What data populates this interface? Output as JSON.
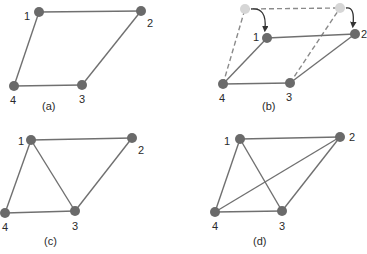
{
  "figure": {
    "panels": [
      {
        "id": "a",
        "caption": "(a)",
        "caption_pos": [
          42,
          110
        ],
        "nodes": [
          {
            "id": "1",
            "label": "1",
            "x": 39,
            "y": 12,
            "lx": 24,
            "ly": 20
          },
          {
            "id": "2",
            "label": "2",
            "x": 141,
            "y": 11,
            "lx": 147,
            "ly": 27
          },
          {
            "id": "3",
            "label": "3",
            "x": 82,
            "y": 85,
            "lx": 79,
            "ly": 103
          },
          {
            "id": "4",
            "label": "4",
            "x": 14,
            "y": 86,
            "lx": 10,
            "ly": 104
          }
        ],
        "edges": [
          [
            "1",
            "2"
          ],
          [
            "2",
            "3"
          ],
          [
            "3",
            "4"
          ],
          [
            "4",
            "1"
          ]
        ],
        "dashed_edges": []
      },
      {
        "id": "b",
        "caption": "(b)",
        "caption_pos": [
          262,
          110
        ],
        "nodes": [
          {
            "id": "1",
            "label": "1",
            "x": 267,
            "y": 38,
            "lx": 253,
            "ly": 41
          },
          {
            "id": "2",
            "label": "2",
            "x": 355,
            "y": 34,
            "lx": 361,
            "ly": 38
          },
          {
            "id": "3",
            "label": "3",
            "x": 290,
            "y": 83,
            "lx": 286,
            "ly": 101
          },
          {
            "id": "4",
            "label": "4",
            "x": 223,
            "y": 84,
            "lx": 219,
            "ly": 102
          }
        ],
        "ghost_nodes": [
          {
            "id": "1'",
            "x": 245,
            "y": 9
          },
          {
            "id": "2'",
            "x": 340,
            "y": 8
          }
        ],
        "edges": [
          [
            "1",
            "2"
          ],
          [
            "2",
            "3"
          ],
          [
            "3",
            "4"
          ],
          [
            "4",
            "1"
          ]
        ],
        "dashed_edges": [
          [
            "1'",
            "2'"
          ],
          [
            "4",
            "1'"
          ],
          [
            "3",
            "2'"
          ]
        ],
        "arrows": [
          {
            "from": "1'",
            "to": "1"
          },
          {
            "from": "2'",
            "to": "2"
          }
        ]
      },
      {
        "id": "c",
        "caption": "(c)",
        "caption_pos": [
          44,
          245
        ],
        "nodes": [
          {
            "id": "1",
            "label": "1",
            "x": 31,
            "y": 140,
            "lx": 18,
            "ly": 145
          },
          {
            "id": "2",
            "label": "2",
            "x": 132,
            "y": 138,
            "lx": 138,
            "ly": 154
          },
          {
            "id": "3",
            "label": "3",
            "x": 75,
            "y": 211,
            "lx": 72,
            "ly": 230
          },
          {
            "id": "4",
            "label": "4",
            "x": 5,
            "y": 213,
            "lx": 2,
            "ly": 231
          }
        ],
        "edges": [
          [
            "1",
            "2"
          ],
          [
            "2",
            "3"
          ],
          [
            "3",
            "4"
          ],
          [
            "4",
            "1"
          ],
          [
            "1",
            "3"
          ]
        ],
        "dashed_edges": []
      },
      {
        "id": "d",
        "caption": "(d)",
        "caption_pos": [
          253,
          245
        ],
        "nodes": [
          {
            "id": "1",
            "label": "1",
            "x": 240,
            "y": 139,
            "lx": 224,
            "ly": 145
          },
          {
            "id": "2",
            "label": "2",
            "x": 340,
            "y": 137,
            "lx": 349,
            "ly": 141
          },
          {
            "id": "3",
            "label": "3",
            "x": 282,
            "y": 211,
            "lx": 279,
            "ly": 230
          },
          {
            "id": "4",
            "label": "4",
            "x": 215,
            "y": 212,
            "lx": 212,
            "ly": 230
          }
        ],
        "edges": [
          [
            "1",
            "2"
          ],
          [
            "2",
            "3"
          ],
          [
            "3",
            "4"
          ],
          [
            "4",
            "1"
          ],
          [
            "1",
            "3"
          ],
          [
            "2",
            "4"
          ]
        ],
        "dashed_edges": []
      }
    ],
    "colors": {
      "node": "#6a6a6a",
      "ghost_node": "#d6d6d6",
      "edge": "#707070",
      "text": "#2a2a2a"
    }
  }
}
